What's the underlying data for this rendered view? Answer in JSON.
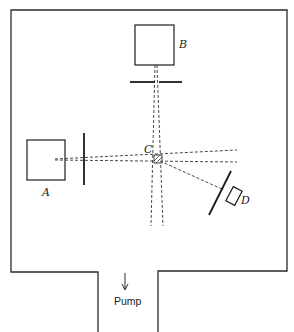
{
  "diagram": {
    "type": "apparatus-schematic",
    "labels": {
      "source_a": "A",
      "source_b": "B",
      "center": "C",
      "detector": "D",
      "pump": "Pump"
    },
    "components": [
      {
        "id": "A",
        "kind": "box",
        "role": "beam source (left)"
      },
      {
        "id": "B",
        "kind": "box",
        "role": "beam source (top)"
      },
      {
        "id": "C",
        "kind": "intersection",
        "role": "beam crossing / scattering center"
      },
      {
        "id": "D",
        "kind": "box",
        "role": "detector (tilted)"
      },
      {
        "id": "pump",
        "kind": "port",
        "role": "vacuum pump outlet",
        "arrow": "down"
      }
    ],
    "colors": {
      "line": "#2a2a2a",
      "background": "#ffffff"
    }
  }
}
